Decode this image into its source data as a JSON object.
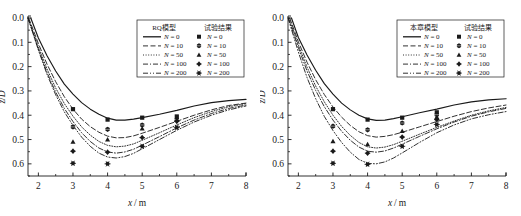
{
  "figure": {
    "panel_count": 2,
    "background": "#ffffff",
    "line_color": "#1a1a1a"
  },
  "chart_data": [
    {
      "type": "line",
      "panel": "left",
      "title": "",
      "xlabel": "x/m",
      "ylabel": "z/D",
      "xlim": [
        1.7,
        8.0
      ],
      "ylim": [
        0.0,
        0.65
      ],
      "y_inverted": true,
      "grid": false,
      "xticks": [
        2,
        3,
        4,
        5,
        6,
        7,
        8
      ],
      "xticklabels": [
        "2",
        "3",
        "4",
        "5",
        "6",
        "7",
        "8"
      ],
      "yticks": [
        0.0,
        0.1,
        0.2,
        0.3,
        0.4,
        0.5,
        0.6
      ],
      "yticklabels": [
        "0.0",
        "0.1",
        "0.2",
        "0.3",
        "0.4",
        "0.5",
        "0.6"
      ],
      "legend_position": "upper right",
      "legend_headers": [
        "RQ模型",
        "试验结果"
      ],
      "series": [
        {
          "name": "N = 0",
          "n": 0,
          "linestyle": "solid",
          "marker": "square",
          "x": [
            1.78,
            2.0,
            2.25,
            2.5,
            2.75,
            3.0,
            3.25,
            3.5,
            3.75,
            4.0,
            4.25,
            4.5,
            4.75,
            5.0,
            5.5,
            6.0,
            6.5,
            7.0,
            7.5,
            8.0
          ],
          "y": [
            0.0,
            0.082,
            0.155,
            0.218,
            0.272,
            0.313,
            0.348,
            0.375,
            0.396,
            0.412,
            0.42,
            0.42,
            0.416,
            0.41,
            0.396,
            0.38,
            0.362,
            0.348,
            0.34,
            0.335
          ],
          "points_x": [
            3.0,
            4.0,
            5.0,
            6.0
          ],
          "points_y": [
            0.375,
            0.418,
            0.41,
            0.405
          ]
        },
        {
          "name": "N = 10",
          "n": 10,
          "linestyle": "dashed",
          "marker": "hexagon",
          "x": [
            1.72,
            2.0,
            2.25,
            2.5,
            2.75,
            3.0,
            3.25,
            3.5,
            3.75,
            4.0,
            4.25,
            4.5,
            4.75,
            5.0,
            5.5,
            6.0,
            6.5,
            7.0,
            7.5,
            8.0
          ],
          "y": [
            0.0,
            0.105,
            0.19,
            0.262,
            0.324,
            0.375,
            0.416,
            0.447,
            0.47,
            0.486,
            0.493,
            0.492,
            0.485,
            0.474,
            0.45,
            0.425,
            0.4,
            0.378,
            0.36,
            0.35
          ],
          "points_x": [
            3.0,
            4.0,
            5.0,
            6.0
          ],
          "points_y": [
            0.448,
            0.458,
            0.44,
            0.418
          ]
        },
        {
          "name": "N = 50",
          "n": 50,
          "linestyle": "dotted",
          "marker": "triangle",
          "x": [
            1.7,
            2.0,
            2.25,
            2.5,
            2.75,
            3.0,
            3.25,
            3.5,
            3.75,
            4.0,
            4.25,
            4.5,
            4.75,
            5.0,
            5.5,
            6.0,
            6.5,
            7.0,
            7.5,
            8.0
          ],
          "y": [
            0.0,
            0.118,
            0.21,
            0.288,
            0.352,
            0.404,
            0.448,
            0.482,
            0.508,
            0.524,
            0.53,
            0.527,
            0.518,
            0.503,
            0.472,
            0.44,
            0.41,
            0.385,
            0.365,
            0.352
          ],
          "points_x": [
            3.0,
            4.0,
            5.0,
            6.0
          ],
          "points_y": [
            0.51,
            0.5,
            0.455,
            0.42
          ]
        },
        {
          "name": "N = 100",
          "n": 100,
          "linestyle": "dashdot",
          "marker": "diamond",
          "x": [
            1.7,
            2.0,
            2.25,
            2.5,
            2.75,
            3.0,
            3.25,
            3.5,
            3.75,
            4.0,
            4.25,
            4.5,
            4.75,
            5.0,
            5.5,
            6.0,
            6.5,
            7.0,
            7.5,
            8.0
          ],
          "y": [
            0.0,
            0.128,
            0.224,
            0.305,
            0.372,
            0.426,
            0.472,
            0.508,
            0.535,
            0.551,
            0.556,
            0.551,
            0.54,
            0.523,
            0.488,
            0.452,
            0.42,
            0.393,
            0.372,
            0.358
          ],
          "points_x": [
            3.0,
            4.0,
            5.0,
            6.0
          ],
          "points_y": [
            0.548,
            0.552,
            0.492,
            0.425
          ]
        },
        {
          "name": "N = 200",
          "n": 200,
          "linestyle": "dashdotdot",
          "marker": "asterisk",
          "x": [
            1.7,
            2.0,
            2.25,
            2.5,
            2.75,
            3.0,
            3.25,
            3.5,
            3.75,
            4.0,
            4.25,
            4.5,
            4.75,
            5.0,
            5.5,
            6.0,
            6.5,
            7.0,
            7.5,
            8.0
          ],
          "y": [
            0.0,
            0.132,
            0.232,
            0.316,
            0.386,
            0.442,
            0.49,
            0.528,
            0.556,
            0.572,
            0.576,
            0.57,
            0.557,
            0.538,
            0.5,
            0.462,
            0.428,
            0.4,
            0.378,
            0.362
          ],
          "points_x": [
            3.0,
            4.0,
            5.0,
            6.0
          ],
          "points_y": [
            0.598,
            0.6,
            0.528,
            0.45
          ]
        }
      ]
    },
    {
      "type": "line",
      "panel": "right",
      "title": "",
      "xlabel": "x/m",
      "ylabel": "z/D",
      "xlim": [
        1.7,
        8.0
      ],
      "ylim": [
        0.0,
        0.65
      ],
      "y_inverted": true,
      "grid": false,
      "xticks": [
        2,
        3,
        4,
        5,
        6,
        7,
        8
      ],
      "xticklabels": [
        "2",
        "3",
        "4",
        "5",
        "6",
        "7",
        "8"
      ],
      "yticks": [
        0.0,
        0.1,
        0.2,
        0.3,
        0.4,
        0.5,
        0.6
      ],
      "yticklabels": [
        "0.0",
        "0.1",
        "0.2",
        "0.3",
        "0.4",
        "0.5",
        "0.6"
      ],
      "legend_position": "upper right",
      "legend_headers": [
        "本章模型",
        "试验结果"
      ],
      "series": [
        {
          "name": "N = 0",
          "n": 0,
          "linestyle": "solid",
          "marker": "square",
          "x": [
            1.8,
            2.0,
            2.25,
            2.5,
            2.75,
            3.0,
            3.25,
            3.5,
            3.75,
            4.0,
            4.25,
            4.5,
            4.75,
            5.0,
            5.5,
            6.0,
            6.5,
            7.0,
            7.5,
            8.0
          ],
          "y": [
            0.0,
            0.08,
            0.152,
            0.215,
            0.27,
            0.313,
            0.35,
            0.378,
            0.4,
            0.415,
            0.421,
            0.42,
            0.414,
            0.406,
            0.39,
            0.375,
            0.358,
            0.345,
            0.337,
            0.332
          ],
          "points_x": [
            3.0,
            4.0,
            5.0,
            6.0
          ],
          "points_y": [
            0.375,
            0.418,
            0.41,
            0.388
          ]
        },
        {
          "name": "N = 10",
          "n": 10,
          "linestyle": "dashed",
          "marker": "hexagon",
          "x": [
            1.75,
            2.0,
            2.25,
            2.5,
            2.75,
            3.0,
            3.25,
            3.5,
            3.75,
            4.0,
            4.25,
            4.5,
            4.75,
            5.0,
            5.5,
            6.0,
            6.5,
            7.0,
            7.5,
            8.0
          ],
          "y": [
            0.0,
            0.098,
            0.182,
            0.254,
            0.315,
            0.366,
            0.408,
            0.442,
            0.468,
            0.484,
            0.49,
            0.487,
            0.48,
            0.47,
            0.448,
            0.426,
            0.404,
            0.385,
            0.37,
            0.358
          ],
          "points_x": [
            3.0,
            4.0,
            5.0,
            6.0
          ],
          "points_y": [
            0.445,
            0.46,
            0.432,
            0.398
          ]
        },
        {
          "name": "N = 50",
          "n": 50,
          "linestyle": "dotted",
          "marker": "triangle",
          "x": [
            1.73,
            2.0,
            2.25,
            2.5,
            2.75,
            3.0,
            3.25,
            3.5,
            3.75,
            4.0,
            4.25,
            4.5,
            4.75,
            5.0,
            5.5,
            6.0,
            6.5,
            7.0,
            7.5,
            8.0
          ],
          "y": [
            0.0,
            0.112,
            0.202,
            0.28,
            0.345,
            0.4,
            0.446,
            0.483,
            0.512,
            0.53,
            0.535,
            0.531,
            0.521,
            0.507,
            0.478,
            0.45,
            0.424,
            0.4,
            0.382,
            0.368
          ],
          "points_x": [
            3.0,
            4.0,
            5.0,
            6.0
          ],
          "points_y": [
            0.508,
            0.52,
            0.465,
            0.408
          ]
        },
        {
          "name": "N = 100",
          "n": 100,
          "linestyle": "dashdot",
          "marker": "diamond",
          "x": [
            1.71,
            2.0,
            2.25,
            2.5,
            2.75,
            3.0,
            3.25,
            3.5,
            3.75,
            4.0,
            4.25,
            4.5,
            4.75,
            5.0,
            5.5,
            6.0,
            6.5,
            7.0,
            7.5,
            8.0
          ],
          "y": [
            0.0,
            0.122,
            0.218,
            0.298,
            0.365,
            0.42,
            0.466,
            0.503,
            0.531,
            0.548,
            0.552,
            0.547,
            0.535,
            0.519,
            0.487,
            0.456,
            0.428,
            0.404,
            0.386,
            0.372
          ],
          "points_x": [
            3.0,
            4.0,
            5.0,
            6.0
          ],
          "points_y": [
            0.548,
            0.556,
            0.49,
            0.418
          ]
        },
        {
          "name": "N = 200",
          "n": 200,
          "linestyle": "dashdotdot",
          "marker": "asterisk",
          "x": [
            1.7,
            2.0,
            2.25,
            2.5,
            2.75,
            3.0,
            3.25,
            3.5,
            3.75,
            4.0,
            4.25,
            4.5,
            4.75,
            5.0,
            5.5,
            6.0,
            6.5,
            7.0,
            7.5,
            8.0
          ],
          "y": [
            0.0,
            0.14,
            0.245,
            0.332,
            0.405,
            0.463,
            0.512,
            0.552,
            0.582,
            0.598,
            0.6,
            0.592,
            0.576,
            0.555,
            0.512,
            0.472,
            0.44,
            0.415,
            0.398,
            0.385
          ],
          "points_x": [
            3.0,
            4.0,
            5.0,
            6.0
          ],
          "points_y": [
            0.598,
            0.602,
            0.528,
            0.438
          ]
        }
      ]
    }
  ]
}
